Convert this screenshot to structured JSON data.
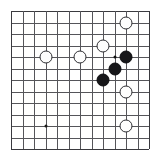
{
  "diagram": {
    "kind": "go-board-diagram",
    "background_color": "#ffffff",
    "line_color": "#55555a",
    "edge_color": "#3a3a3f",
    "white_stone_color": "#fdfdfd",
    "white_stone_border_color": "#2e2e33",
    "black_stone_color": "#17171a",
    "star_point_color": "#1a1a1a",
    "board": {
      "columns": 13,
      "rows": 13,
      "left": 11,
      "top": 11,
      "spacing": 11.5,
      "stone_diameter": 13
    },
    "star_points": [
      {
        "col": 3,
        "row": 10
      }
    ],
    "markers": [
      {
        "col": 9,
        "row": 4,
        "type": "dot"
      }
    ],
    "stones": [
      {
        "color": "white",
        "col": 10,
        "row": 1
      },
      {
        "color": "white",
        "col": 8,
        "row": 3
      },
      {
        "color": "white",
        "col": 3,
        "row": 4
      },
      {
        "color": "white",
        "col": 6,
        "row": 4
      },
      {
        "color": "black",
        "col": 10,
        "row": 4
      },
      {
        "color": "black",
        "col": 9,
        "row": 5
      },
      {
        "color": "black",
        "col": 8,
        "row": 6
      },
      {
        "color": "white",
        "col": 10,
        "row": 7
      },
      {
        "color": "white",
        "col": 10,
        "row": 10
      }
    ]
  }
}
